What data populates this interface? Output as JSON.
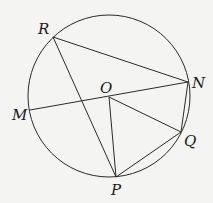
{
  "diagram": {
    "type": "circle-geometry",
    "circle": {
      "cx": 109,
      "cy": 96,
      "r": 81
    },
    "points": {
      "R": {
        "x": 53,
        "y": 37,
        "label": "R",
        "lx": 38,
        "ly": 34
      },
      "N": {
        "x": 188,
        "y": 82,
        "label": "N",
        "lx": 192,
        "ly": 88
      },
      "M": {
        "x": 30,
        "y": 110,
        "label": "M",
        "lx": 12,
        "ly": 120
      },
      "O": {
        "x": 109,
        "y": 97,
        "label": "O",
        "lx": 100,
        "ly": 93
      },
      "Q": {
        "x": 181,
        "y": 132,
        "label": "Q",
        "lx": 184,
        "ly": 146
      },
      "P": {
        "x": 116,
        "y": 177,
        "label": "P",
        "lx": 111,
        "ly": 195
      }
    },
    "segments": [
      [
        "R",
        "N"
      ],
      [
        "R",
        "P"
      ],
      [
        "M",
        "N"
      ],
      [
        "O",
        "P"
      ],
      [
        "O",
        "Q"
      ],
      [
        "N",
        "Q"
      ],
      [
        "P",
        "Q"
      ]
    ],
    "stroke_color": "#2a2a2a"
  }
}
